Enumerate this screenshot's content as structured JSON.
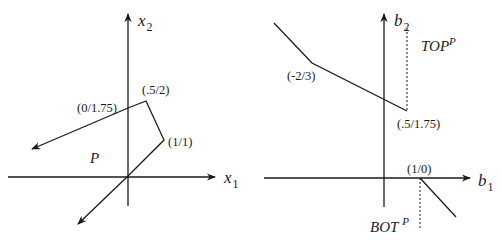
{
  "left_panel": {
    "x_axis_label": "x",
    "x_axis_sub": "1",
    "y_axis_label": "x",
    "y_axis_sub": "2",
    "region_label": "P",
    "points": [
      {
        "label": "(0/1.75)"
      },
      {
        "label": "(.5/2)"
      },
      {
        "label": "(1/1)"
      }
    ]
  },
  "right_panel": {
    "x_axis_label": "b",
    "x_axis_sub": "1",
    "y_axis_label": "b",
    "y_axis_sub": "2",
    "top_label": "TOP",
    "top_sup": "P",
    "bot_label": "BOT",
    "bot_sup": "P",
    "points": [
      {
        "label": "(-2/3)"
      },
      {
        "label": "(.5/1.75)"
      },
      {
        "label": "(1/0)"
      }
    ]
  },
  "colors": {
    "ink": "#1a1a1a",
    "background": "#ffffff"
  }
}
